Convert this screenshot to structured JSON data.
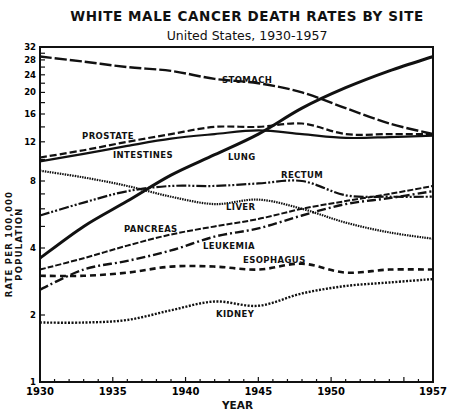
{
  "chart_data": {
    "type": "line",
    "title": "WHITE MALE CANCER DEATH RATES BY SITE",
    "subtitle": "United States, 1930-1957",
    "xlabel": "YEAR",
    "ylabel": "RATE PER 100,000 POPULATION",
    "yscale": "log",
    "ylim": [
      1,
      32
    ],
    "xlim": [
      1930,
      1957
    ],
    "x_ticks": [
      1930,
      1935,
      1940,
      1945,
      1950,
      1957
    ],
    "y_ticks": [
      1,
      2,
      4,
      8,
      12,
      16,
      20,
      24,
      28,
      32
    ],
    "grid": false,
    "legend": "inline labels",
    "x": [
      1930,
      1933,
      1936,
      1939,
      1942,
      1945,
      1948,
      1951,
      1954,
      1957
    ],
    "series": [
      {
        "name": "STOMACH",
        "style": "long-dash",
        "values": [
          29,
          27.5,
          26,
          25,
          23,
          22,
          20,
          17,
          14.5,
          13
        ]
      },
      {
        "name": "PROSTATE",
        "style": "dashed",
        "values": [
          10.2,
          11,
          12,
          13,
          14,
          14,
          14.5,
          13,
          13,
          13
        ]
      },
      {
        "name": "INTESTINES",
        "style": "solid-hatched",
        "values": [
          9.8,
          10.6,
          11.5,
          12.4,
          13,
          13.5,
          13,
          12.5,
          12.6,
          12.8
        ]
      },
      {
        "name": "LUNG",
        "style": "solid-thick",
        "values": [
          3.6,
          5,
          6.5,
          8.5,
          10.5,
          13,
          17,
          21,
          25,
          29
        ]
      },
      {
        "name": "RECTUM",
        "style": "dash-dot-dot",
        "values": [
          5.6,
          6.4,
          7.2,
          7.6,
          7.6,
          7.8,
          8,
          6.9,
          6.8,
          6.8
        ]
      },
      {
        "name": "LIVER",
        "style": "dotted-dense",
        "values": [
          8.9,
          8.3,
          7.6,
          6.8,
          6.3,
          6.6,
          6,
          5.2,
          4.7,
          4.4
        ]
      },
      {
        "name": "PANCREAS",
        "style": "dashed-fine",
        "values": [
          3.2,
          3.6,
          4.1,
          4.6,
          5,
          5.4,
          6,
          6.5,
          7,
          7.6
        ]
      },
      {
        "name": "LEUKEMIA",
        "style": "dash-dot",
        "values": [
          2.6,
          3.2,
          3.5,
          3.9,
          4.5,
          4.9,
          5.6,
          6.3,
          6.7,
          7.2
        ]
      },
      {
        "name": "ESOPHAGUS",
        "style": "dashed-heavy",
        "values": [
          3.0,
          3.0,
          3.1,
          3.3,
          3.3,
          3.2,
          3.4,
          3.1,
          3.2,
          3.2
        ]
      },
      {
        "name": "KIDNEY",
        "style": "dotted",
        "values": [
          1.85,
          1.85,
          1.9,
          2.1,
          2.3,
          2.2,
          2.5,
          2.7,
          2.8,
          2.9
        ]
      }
    ],
    "labels": [
      {
        "text": "STOMACH",
        "x": 222,
        "y": 83
      },
      {
        "text": "PROSTATE",
        "x": 82,
        "y": 139
      },
      {
        "text": "INTESTINES",
        "x": 113,
        "y": 158
      },
      {
        "text": "LUNG",
        "x": 228,
        "y": 160
      },
      {
        "text": "RECTUM",
        "x": 281,
        "y": 178
      },
      {
        "text": "LIVER",
        "x": 226,
        "y": 210
      },
      {
        "text": "PANCREAS",
        "x": 124,
        "y": 232
      },
      {
        "text": "LEUKEMIA",
        "x": 203,
        "y": 249
      },
      {
        "text": "ESOPHAGUS",
        "x": 243,
        "y": 263
      },
      {
        "text": "KIDNEY",
        "x": 216,
        "y": 317
      }
    ]
  }
}
